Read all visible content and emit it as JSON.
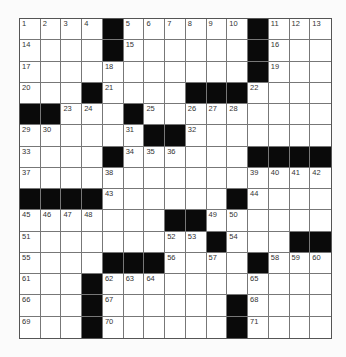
{
  "puzzle": {
    "rows": 15,
    "cols": 15,
    "colors": {
      "black": "#0a0a0a",
      "white": "#ffffff",
      "grid_line": "#777777"
    },
    "grid": [
      [
        "1",
        "2",
        "3",
        "4",
        "#",
        "5",
        "6",
        "7",
        "8",
        "9",
        "10",
        "#",
        "11",
        "12",
        "13"
      ],
      [
        "14",
        ".",
        ".",
        ".",
        "#",
        "15",
        ".",
        ".",
        ".",
        ".",
        ".",
        "#",
        "16",
        ".",
        "."
      ],
      [
        "17",
        ".",
        ".",
        ".",
        "18",
        ".",
        ".",
        ".",
        ".",
        ".",
        ".",
        "#",
        "19",
        ".",
        "."
      ],
      [
        "20",
        ".",
        ".",
        "#",
        "21",
        ".",
        ".",
        ".",
        "#",
        "#",
        "#",
        "22",
        ".",
        ".",
        "."
      ],
      [
        "#",
        "#",
        "23",
        "24",
        ".",
        "#",
        "25",
        ".",
        "26",
        "27",
        "28",
        ".",
        ".",
        ".",
        "."
      ],
      [
        "29",
        "30",
        ".",
        ".",
        ".",
        "31",
        "#",
        "#",
        "32",
        ".",
        ".",
        ".",
        ".",
        ".",
        "."
      ],
      [
        "33",
        ".",
        ".",
        ".",
        "#",
        "34",
        "35",
        "36",
        ".",
        ".",
        ".",
        "#",
        "#",
        "#",
        "#"
      ],
      [
        "37",
        ".",
        ".",
        ".",
        "38",
        ".",
        ".",
        ".",
        ".",
        ".",
        ".",
        "39",
        "40",
        "41",
        "42"
      ],
      [
        "#",
        "#",
        "#",
        "#",
        "43",
        ".",
        ".",
        ".",
        ".",
        ".",
        "#",
        "44",
        ".",
        ".",
        "."
      ],
      [
        "45",
        "46",
        "47",
        "48",
        ".",
        ".",
        ".",
        "#",
        "#",
        "49",
        "50",
        ".",
        ".",
        ".",
        "."
      ],
      [
        "51",
        ".",
        ".",
        ".",
        ".",
        ".",
        ".",
        "52",
        "53",
        "#",
        "54",
        ".",
        ".",
        "#",
        "#"
      ],
      [
        "55",
        ".",
        ".",
        ".",
        "#",
        "#",
        "#",
        "56",
        ".",
        "57",
        ".",
        "#",
        "58",
        "59",
        "60"
      ],
      [
        "61",
        ".",
        ".",
        "#",
        "62",
        "63",
        "64",
        ".",
        ".",
        ".",
        ".",
        "65",
        ".",
        ".",
        "."
      ],
      [
        "66",
        ".",
        ".",
        "#",
        "67",
        ".",
        ".",
        ".",
        ".",
        ".",
        "#",
        "68",
        ".",
        ".",
        "."
      ],
      [
        "69",
        ".",
        ".",
        "#",
        "70",
        ".",
        ".",
        ".",
        ".",
        ".",
        "#",
        "71",
        ".",
        ".",
        "."
      ]
    ]
  }
}
